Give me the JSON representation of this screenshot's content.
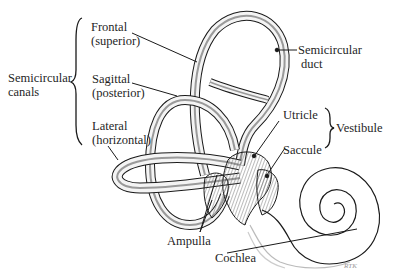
{
  "diagram": {
    "groups": {
      "semicircular_canals": {
        "line1": "Semicircular",
        "line2": "canals"
      },
      "vestibule": "Vestibule"
    },
    "labels": {
      "frontal": {
        "line1": "Frontal",
        "line2": "(superior)"
      },
      "sagittal": {
        "line1": "Sagittal",
        "line2": "(posterior)"
      },
      "lateral": {
        "line1": "Lateral",
        "line2": "(horizontal)"
      },
      "semicircular_duct": {
        "line1": "Semicircular",
        "line2": "duct"
      },
      "utricle": "Utricle",
      "saccule": "Saccule",
      "ampulla": "Ampulla",
      "cochlea": "Cochlea"
    },
    "signature": "RTK",
    "colors": {
      "ink": "#1a1a1a",
      "canal_fill": "#f4f4f4",
      "duct_shade": "#9a9a9a",
      "background": "#ffffff"
    }
  }
}
